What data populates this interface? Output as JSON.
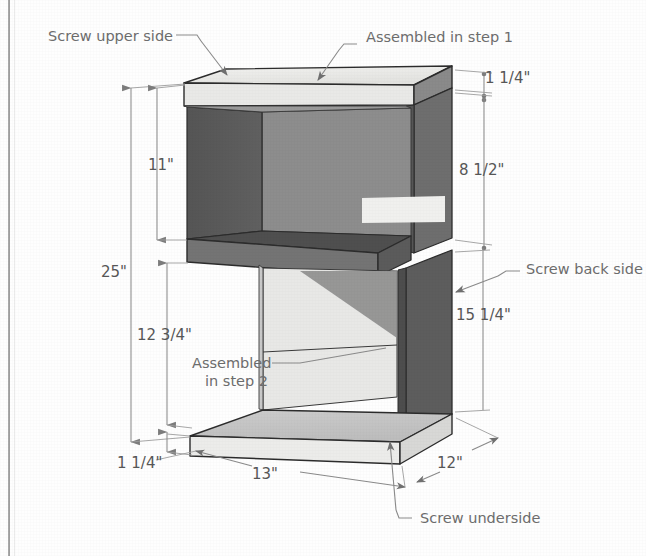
{
  "figure": {
    "type": "isometric-technical-drawing"
  },
  "colors": {
    "top_face": "#ededeb",
    "front_panel": "#8e8e8e",
    "side_panel_dark": "#5a5a5a",
    "interior_back": "#6f6f6f",
    "shelf_edge_dark": "#4a4a4a",
    "base_top": "#c9c9c9",
    "base_front": "#e2e2e0",
    "highlight": "#f0f0ee",
    "line": "#2c2c2c",
    "text": "#6d6d6d",
    "dimension": "#8a8a8a"
  },
  "annotations": [
    {
      "id": "screw-upper-side",
      "label": "Screw upper side"
    },
    {
      "id": "assembled-step-1",
      "label": "Assembled in step 1"
    },
    {
      "id": "screw-back-side",
      "label": "Screw back side"
    },
    {
      "id": "assembled-step-2-line1",
      "label": "Assembled"
    },
    {
      "id": "assembled-step-2-line2",
      "label": "in step 2"
    },
    {
      "id": "screw-underside",
      "label": "Screw underside"
    }
  ],
  "dimensions": [
    {
      "id": "dim-11",
      "value": "11\"",
      "orientation": "vertical",
      "note": "upper shelf opening height"
    },
    {
      "id": "dim-25",
      "value": "25\"",
      "orientation": "vertical",
      "note": "overall height"
    },
    {
      "id": "dim-12-3-4",
      "value": "12 3/4\"",
      "orientation": "vertical",
      "note": "lower cavity height"
    },
    {
      "id": "dim-1-1-4-bottom",
      "value": "1 1/4\"",
      "orientation": "vertical",
      "note": "base thickness"
    },
    {
      "id": "dim-1-1-4-top",
      "value": "1 1/4\"",
      "orientation": "vertical",
      "note": "top panel thickness"
    },
    {
      "id": "dim-8-1-2",
      "value": "8 1/2\"",
      "orientation": "vertical",
      "note": "right upper side panel height"
    },
    {
      "id": "dim-15-1-4",
      "value": "15 1/4\"",
      "orientation": "vertical",
      "note": "right lower side panel height"
    },
    {
      "id": "dim-13",
      "value": "13\"",
      "orientation": "horizontal",
      "note": "base width"
    },
    {
      "id": "dim-12",
      "value": "12\"",
      "orientation": "depth",
      "note": "base depth"
    }
  ]
}
